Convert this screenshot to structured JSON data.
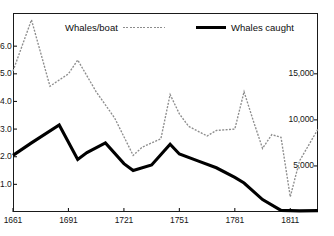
{
  "chart_data": {
    "type": "line",
    "title": "",
    "subtitle": "",
    "xlabel": "",
    "ylabel": "Whales/boat",
    "y2label": "Whales caught",
    "grid": false,
    "legend_position": "top",
    "xlim": [
      1661,
      1826
    ],
    "ylim": [
      0,
      7.2
    ],
    "y2lim": [
      0,
      21600
    ],
    "xticks": [
      1661,
      1691,
      1721,
      1751,
      1781,
      1811
    ],
    "xticklabels": [
      "1661",
      "1691",
      "1721",
      "1751",
      "1781",
      "1811"
    ],
    "yticks": [
      1.0,
      2.0,
      3.0,
      4.0,
      5.0,
      6.0
    ],
    "yticklabels": [
      "1.0",
      "2.0",
      "3.0",
      "4.0",
      "5.0",
      "6.0"
    ],
    "y2ticks": [
      5000,
      10000,
      15000
    ],
    "y2ticklabels": [
      "5,000",
      "10,000",
      "15,000"
    ],
    "series": [
      {
        "name": "Whales/boat",
        "axis": "left",
        "style": "dotted",
        "color": "#8d8d8d",
        "x": [
          1661,
          1671,
          1681,
          1691,
          1696,
          1706,
          1716,
          1726,
          1731,
          1741,
          1746,
          1751,
          1756,
          1766,
          1771,
          1781,
          1786,
          1791,
          1796,
          1801,
          1806,
          1811,
          1816,
          1826
        ],
        "values": [
          5.1,
          6.95,
          4.55,
          5.0,
          5.5,
          4.35,
          3.4,
          2.05,
          2.35,
          2.65,
          4.25,
          3.55,
          3.1,
          2.75,
          2.95,
          3.0,
          4.35,
          3.3,
          2.3,
          2.8,
          2.7,
          0.55,
          1.85,
          3.0
        ]
      },
      {
        "name": "Whales caught",
        "axis": "right",
        "style": "solid",
        "color": "#000000",
        "x": [
          1661,
          1671,
          1686,
          1696,
          1701,
          1711,
          1721,
          1726,
          1736,
          1746,
          1751,
          1761,
          1771,
          1781,
          1786,
          1796,
          1806,
          1816,
          1826
        ],
        "values_left_scale": [
          2.05,
          2.5,
          3.15,
          1.9,
          2.15,
          2.5,
          1.75,
          1.5,
          1.7,
          2.45,
          2.1,
          1.85,
          1.6,
          1.25,
          1.05,
          0.45,
          0.06,
          0.04,
          0.05
        ],
        "values": [
          6150,
          7500,
          9450,
          5700,
          6450,
          7500,
          5250,
          4500,
          5100,
          7350,
          6300,
          5550,
          4800,
          3750,
          3150,
          1350,
          180,
          120,
          150
        ]
      }
    ],
    "legend": [
      {
        "label": "Whales/boat",
        "swatch": "dotted-gray-line"
      },
      {
        "label": "Whales caught",
        "swatch": "solid-black-line"
      }
    ],
    "colors": {
      "whales_per_boat": "#8d8d8d",
      "whales_caught": "#000000",
      "frame": "#1a1a1a",
      "background": "#ffffff"
    }
  }
}
